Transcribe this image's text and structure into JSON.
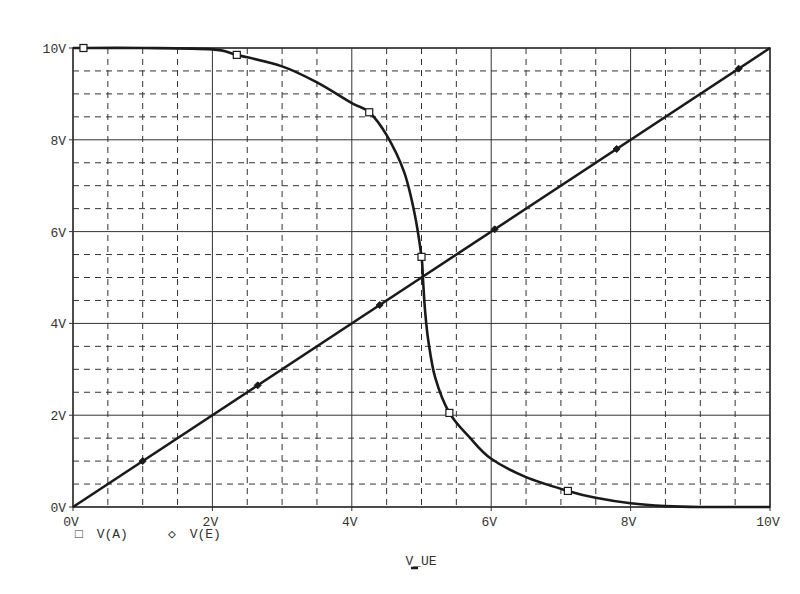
{
  "chart_data": {
    "type": "line",
    "title": "",
    "xlabel": "V_UE",
    "ylabel": "",
    "xlim": [
      0,
      10
    ],
    "ylim": [
      0,
      10
    ],
    "x_ticks": [
      "0V",
      "2V",
      "4V",
      "6V",
      "8V",
      "10V"
    ],
    "y_ticks": [
      "0V",
      "2V",
      "4V",
      "6V",
      "8V",
      "10V"
    ],
    "grid": {
      "major_step": 2,
      "minor_step": 0.5,
      "major_style": "solid",
      "minor_style": "dashed"
    },
    "legend_position": "bottom-left",
    "series": [
      {
        "name": "V(A)",
        "marker": "square",
        "x": [
          0,
          1,
          2,
          2.35,
          3,
          3.5,
          4,
          4.25,
          4.5,
          4.75,
          4.9,
          5.0,
          5.02,
          5.05,
          5.1,
          5.2,
          5.4,
          5.7,
          6.0,
          6.5,
          7.1,
          7.5,
          8.0,
          8.5,
          9,
          10
        ],
        "y": [
          10,
          10,
          9.97,
          9.85,
          9.6,
          9.25,
          8.8,
          8.6,
          8.1,
          7.3,
          6.4,
          5.45,
          5.0,
          4.3,
          3.6,
          2.8,
          2.05,
          1.5,
          1.05,
          0.65,
          0.35,
          0.2,
          0.08,
          0.02,
          0,
          0
        ],
        "marker_points": [
          [
            0.15,
            10
          ],
          [
            2.35,
            9.85
          ],
          [
            4.25,
            8.6
          ],
          [
            5.0,
            5.45
          ],
          [
            5.4,
            2.05
          ],
          [
            7.1,
            0.35
          ]
        ]
      },
      {
        "name": "V(E)",
        "marker": "diamond",
        "x": [
          0,
          10
        ],
        "y": [
          0,
          10
        ],
        "marker_points": [
          [
            1.0,
            1.0
          ],
          [
            2.65,
            2.65
          ],
          [
            4.4,
            4.4
          ],
          [
            6.05,
            6.05
          ],
          [
            7.8,
            7.8
          ],
          [
            9.55,
            9.55
          ]
        ]
      }
    ]
  },
  "legend": {
    "items": [
      {
        "symbol": "□",
        "label": "V(A)"
      },
      {
        "symbol": "◇",
        "label": "V(E)"
      }
    ]
  },
  "colors": {
    "line": "#1a1a1a",
    "grid": "#333333",
    "text": "#333333",
    "background": "#ffffff"
  }
}
